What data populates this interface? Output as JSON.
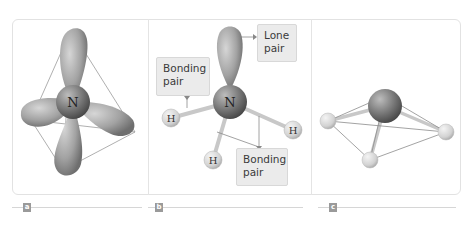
{
  "figure": {
    "panels": [
      {
        "id": "a",
        "label": "a",
        "description": "Tetrahedral arrangement of four electron-pair orbitals around nitrogen",
        "atom": "N"
      },
      {
        "id": "b",
        "label": "b",
        "description": "Ammonia molecule showing lone pair and bonding pairs",
        "atom": "N",
        "hydrogens": [
          "H",
          "H",
          "H"
        ],
        "callouts": {
          "lone_pair": [
            "Lone",
            "pair"
          ],
          "bonding_pair_left": [
            "Bonding",
            "pair"
          ],
          "bonding_pair_bottom": [
            "Bonding",
            "pair"
          ]
        }
      },
      {
        "id": "c",
        "label": "c",
        "description": "Trigonal pyramidal ball-and-stick model"
      }
    ]
  },
  "colors": {
    "frame_border": "#e2e2e2",
    "callout_bg": "#ebebeb",
    "badge_bg": "#9a9a9a",
    "lobe_gray": "#9b9b9b",
    "hydrogen_gray": "#d9d9d9"
  }
}
